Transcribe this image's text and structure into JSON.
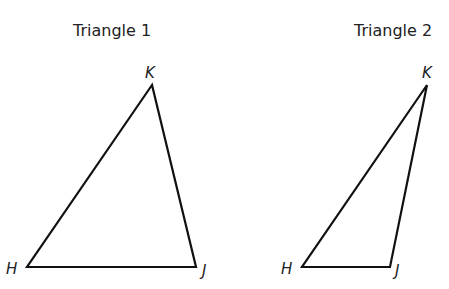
{
  "triangles": [
    {
      "title": "Triangle 1",
      "vertices": {
        "K": {
          "label": "K",
          "x": 152,
          "y": 85
        },
        "H": {
          "label": "H",
          "x": 27,
          "y": 267
        },
        "J": {
          "label": "J",
          "x": 196,
          "y": 267
        }
      }
    },
    {
      "title": "Triangle 2",
      "vertices": {
        "K": {
          "label": "K",
          "x": 427,
          "y": 85
        },
        "H": {
          "label": "H",
          "x": 302,
          "y": 267
        },
        "J": {
          "label": "J",
          "x": 390,
          "y": 267
        }
      }
    }
  ],
  "colors": {
    "stroke": "#111111",
    "text": "#222222"
  }
}
